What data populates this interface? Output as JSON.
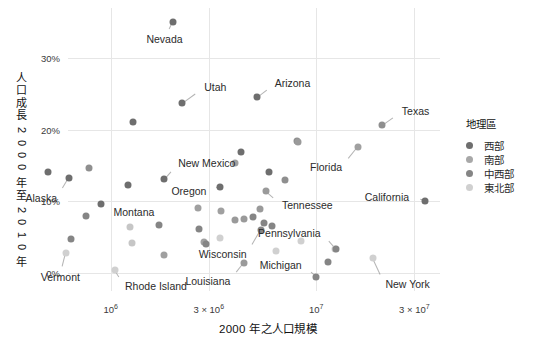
{
  "chart_data": {
    "type": "scatter",
    "title": "",
    "xlabel": "2000 年之人口規模",
    "ylabel": "人口成長 2000 年至 2010 年",
    "xscale": "log",
    "xlim": [
      620000,
      40000000
    ],
    "ylim": [
      -2.5,
      37
    ],
    "xticks": [
      {
        "value": 1000000,
        "label": "10",
        "exp": "6",
        "prefix": ""
      },
      {
        "value": 3000000,
        "label": "10",
        "exp": "6",
        "prefix": "3 × "
      },
      {
        "value": 10000000,
        "label": "10",
        "exp": "7",
        "prefix": ""
      },
      {
        "value": 30000000,
        "label": "10",
        "exp": "7",
        "prefix": "3 × "
      }
    ],
    "yticks": [
      {
        "value": 0,
        "label": "0%"
      },
      {
        "value": 10,
        "label": "10%"
      },
      {
        "value": 20,
        "label": "20%"
      },
      {
        "value": 30,
        "label": "30%"
      }
    ],
    "grid": true,
    "legend": {
      "title": "地理區",
      "position": "right",
      "entries": [
        {
          "label": "西部",
          "color": "#6e6e6e"
        },
        {
          "label": "南部",
          "color": "#a8a8a8"
        },
        {
          "label": "中西部",
          "color": "#858585"
        },
        {
          "label": "東北部",
          "color": "#d0d0d0"
        }
      ]
    },
    "points": [
      {
        "name": "Nevada",
        "x": 2000000,
        "y": 35.1,
        "region": "西部",
        "color": "#6e6e6e",
        "label": {
          "dx": -8,
          "dy": 17,
          "anchor": "middle"
        }
      },
      {
        "name": "Arizona",
        "x": 5130000,
        "y": 24.6,
        "region": "西部",
        "color": "#6e6e6e",
        "label": {
          "dx": 18,
          "dy": -14,
          "anchor": "start"
        }
      },
      {
        "name": "Utah",
        "x": 2230000,
        "y": 23.8,
        "region": "西部",
        "color": "#6e6e6e",
        "label": {
          "dx": 22,
          "dy": -16,
          "anchor": "start"
        }
      },
      {
        "name": "Texas",
        "x": 20850000,
        "y": 20.6,
        "region": "南部",
        "color": "#8f8f8f",
        "label": {
          "dx": 20,
          "dy": -14,
          "anchor": "start"
        }
      },
      {
        "name": "Idaho",
        "x": 1290000,
        "y": 21.1,
        "region": "西部",
        "color": "#6e6e6e",
        "label": null
      },
      {
        "name": "Florida",
        "x": 15980000,
        "y": 17.6,
        "region": "南部",
        "color": "#a0a0a0",
        "label": {
          "dx": -16,
          "dy": 20,
          "anchor": "end"
        }
      },
      {
        "name": "NorthCarolina",
        "x": 8050000,
        "y": 18.5,
        "region": "南部",
        "color": "#8f8f8f",
        "label": null
      },
      {
        "name": "Georgia",
        "x": 8190000,
        "y": 18.3,
        "region": "南部",
        "color": "#9a9a9a",
        "label": null
      },
      {
        "name": "Colorado",
        "x": 4300000,
        "y": 16.9,
        "region": "西部",
        "color": "#6e6e6e",
        "label": null
      },
      {
        "name": "SouthCarolina",
        "x": 4010000,
        "y": 15.3,
        "region": "南部",
        "color": "#a0a0a0",
        "label": null
      },
      {
        "name": "Delaware",
        "x": 783000,
        "y": 14.6,
        "region": "南部",
        "color": "#8f8f8f",
        "label": null
      },
      {
        "name": "Alaska",
        "x": 627000,
        "y": 13.3,
        "region": "西部",
        "color": "#6e6e6e",
        "label": {
          "dx": -12,
          "dy": 20,
          "anchor": "end"
        }
      },
      {
        "name": "NewMexico",
        "x": 1820000,
        "y": 13.2,
        "region": "西部",
        "color": "#6e6e6e",
        "label": {
          "dx": 14,
          "dy": -16,
          "anchor": "start"
        }
      },
      {
        "name": "Virginia",
        "x": 7080000,
        "y": 13.0,
        "region": "南部",
        "color": "#8f8f8f",
        "label": null
      },
      {
        "name": "Washington",
        "x": 5890000,
        "y": 14.1,
        "region": "西部",
        "color": "#6e6e6e",
        "label": null
      },
      {
        "name": "Oregon",
        "x": 3420000,
        "y": 12.0,
        "region": "西部",
        "color": "#6e6e6e",
        "label": {
          "dx": -14,
          "dy": 4,
          "anchor": "end"
        }
      },
      {
        "name": "Hawaii",
        "x": 1210000,
        "y": 12.3,
        "region": "西部",
        "color": "#6e6e6e",
        "label": null
      },
      {
        "name": "Tennessee",
        "x": 5690000,
        "y": 11.5,
        "region": "南部",
        "color": "#9a9a9a",
        "label": {
          "dx": 16,
          "dy": 14,
          "anchor": "start"
        }
      },
      {
        "name": "California",
        "x": 33870000,
        "y": 10.0,
        "region": "西部",
        "color": "#6e6e6e",
        "label": {
          "dx": -16,
          "dy": -4,
          "anchor": "end"
        }
      },
      {
        "name": "Montana",
        "x": 902000,
        "y": 9.7,
        "region": "西部",
        "color": "#6e6e6e",
        "label": {
          "dx": 12,
          "dy": 8,
          "anchor": "start"
        }
      },
      {
        "name": "Wyoming",
        "x": 494000,
        "y": 14.1,
        "region": "西部",
        "color": "#6e6e6e",
        "label": null
      },
      {
        "name": "Maryland",
        "x": 5300000,
        "y": 9.0,
        "region": "南部",
        "color": "#9a9a9a",
        "label": null
      },
      {
        "name": "Arkansas",
        "x": 2670000,
        "y": 9.1,
        "region": "南部",
        "color": "#a0a0a0",
        "label": null
      },
      {
        "name": "Oklahoma",
        "x": 3450000,
        "y": 8.7,
        "region": "南部",
        "color": "#a0a0a0",
        "label": null
      },
      {
        "name": "SouthDakota",
        "x": 755000,
        "y": 7.9,
        "region": "中西部",
        "color": "#858585",
        "label": null
      },
      {
        "name": "Minnesota",
        "x": 4920000,
        "y": 7.8,
        "region": "中西部",
        "color": "#858585",
        "label": null
      },
      {
        "name": "Kentucky",
        "x": 4040000,
        "y": 7.4,
        "region": "南部",
        "color": "#9a9a9a",
        "label": null
      },
      {
        "name": "NewHampshire",
        "x": 1240000,
        "y": 6.5,
        "region": "東北部",
        "color": "#c6c6c6",
        "label": null
      },
      {
        "name": "Nebraska",
        "x": 1710000,
        "y": 6.7,
        "region": "中西部",
        "color": "#858585",
        "label": null
      },
      {
        "name": "Indiana",
        "x": 6080000,
        "y": 6.6,
        "region": "中西部",
        "color": "#858585",
        "label": null
      },
      {
        "name": "Missouri",
        "x": 5600000,
        "y": 7.0,
        "region": "中西部",
        "color": "#858585",
        "label": null
      },
      {
        "name": "Wisconsin",
        "x": 5360000,
        "y": 6.0,
        "region": "中西部",
        "color": "#858585",
        "label": {
          "dx": -14,
          "dy": 24,
          "anchor": "end"
        }
      },
      {
        "name": "Alabama",
        "x": 4450000,
        "y": 7.5,
        "region": "南部",
        "color": "#9a9a9a",
        "label": null
      },
      {
        "name": "Kansas",
        "x": 2690000,
        "y": 6.1,
        "region": "中西部",
        "color": "#858585",
        "label": null
      },
      {
        "name": "Mississippi",
        "x": 2840000,
        "y": 4.3,
        "region": "南部",
        "color": "#a0a0a0",
        "label": null
      },
      {
        "name": "Maine",
        "x": 1270000,
        "y": 4.2,
        "region": "東北部",
        "color": "#c6c6c6",
        "label": null
      },
      {
        "name": "NewJersey",
        "x": 8410000,
        "y": 4.5,
        "region": "東北部",
        "color": "#d0d0d0",
        "label": null
      },
      {
        "name": "Iowa",
        "x": 2920000,
        "y": 4.1,
        "region": "中西部",
        "color": "#858585",
        "label": null
      },
      {
        "name": "Pennsylvania",
        "x": 12280000,
        "y": 3.4,
        "region": "東北部",
        "color": "#d0d0d0",
        "label": {
          "dx": -14,
          "dy": -16,
          "anchor": "end"
        }
      },
      {
        "name": "Illinois",
        "x": 12420000,
        "y": 3.3,
        "region": "中西部",
        "color": "#858585",
        "label": null
      },
      {
        "name": "Connecticut",
        "x": 3400000,
        "y": 4.9,
        "region": "東北部",
        "color": "#d0d0d0",
        "label": null
      },
      {
        "name": "WestVirginia",
        "x": 1810000,
        "y": 2.5,
        "region": "南部",
        "color": "#a0a0a0",
        "label": null
      },
      {
        "name": "Vermont",
        "x": 609000,
        "y": 2.8,
        "region": "東北部",
        "color": "#d0d0d0",
        "label": {
          "dx": -6,
          "dy": 24,
          "anchor": "middle"
        }
      },
      {
        "name": "NewYork",
        "x": 18980000,
        "y": 2.1,
        "region": "東北部",
        "color": "#d0d0d0",
        "label": {
          "dx": 12,
          "dy": 26,
          "anchor": "start"
        }
      },
      {
        "name": "Louisiana",
        "x": 4470000,
        "y": 1.4,
        "region": "南部",
        "color": "#9a9a9a",
        "label": {
          "dx": -14,
          "dy": 18,
          "anchor": "end"
        }
      },
      {
        "name": "Ohio",
        "x": 11350000,
        "y": 1.6,
        "region": "中西部",
        "color": "#858585",
        "label": null
      },
      {
        "name": "RhodeIsland",
        "x": 1050000,
        "y": 0.4,
        "region": "東北部",
        "color": "#d0d0d0",
        "label": {
          "dx": 10,
          "dy": 16,
          "anchor": "start"
        }
      },
      {
        "name": "Michigan",
        "x": 9940000,
        "y": -0.6,
        "region": "中西部",
        "color": "#858585",
        "label": {
          "dx": -14,
          "dy": -12,
          "anchor": "end"
        }
      },
      {
        "name": "NorthDakota",
        "x": 642000,
        "y": 4.7,
        "region": "中西部",
        "color": "#858585",
        "label": null
      },
      {
        "name": "Massachusetts",
        "x": 6350000,
        "y": 3.1,
        "region": "東北部",
        "color": "#d0d0d0",
        "label": null
      }
    ],
    "point_labels": [
      "Nevada",
      "Utah",
      "Arizona",
      "Texas",
      "Florida",
      "New Mexico",
      "Oregon",
      "Alaska",
      "Montana",
      "Tennessee",
      "California",
      "Wisconsin",
      "Pennsylvania",
      "Michigan",
      "Louisiana",
      "Rhode Island",
      "Vermont",
      "New York"
    ]
  }
}
